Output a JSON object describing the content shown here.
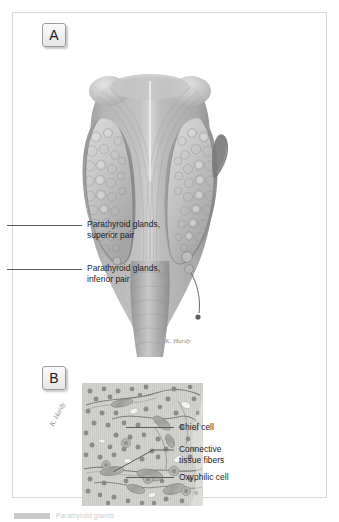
{
  "figure": {
    "panels": [
      {
        "id": "A",
        "letter": "A",
        "kind": "gross-anatomy-illustration",
        "subject": "Posterior view of the thyroid gland showing the parathyroid glands",
        "signature": "K. Hardy",
        "callouts": [
          {
            "id": "parathyroid-superior",
            "text": "Parathyroid glands,\nsuperior pair"
          },
          {
            "id": "parathyroid-inferior",
            "text": "Parathyroid glands,\ninferior pair"
          }
        ]
      },
      {
        "id": "B",
        "letter": "B",
        "kind": "histology-micrograph-illustration",
        "subject": "Parathyroid gland tissue, light micrograph drawing",
        "signature": "K. Hardy",
        "callouts": [
          {
            "id": "chief-cell",
            "text": "Chief cell"
          },
          {
            "id": "connective-tissue-fibers",
            "text": "Connective\ntissue fibers"
          },
          {
            "id": "oxyphilic-cell",
            "text": "Oxyphilic cell"
          }
        ]
      }
    ]
  },
  "caption": {
    "swatch_label": "",
    "text": "Parathyroid glands"
  },
  "palette": {
    "frame_border": "#d8d8d8",
    "page_background": "#ffffff",
    "leader_line": "#5a5a5a",
    "label_text": "#1c1c1c",
    "badge_border": "#9a9a9a",
    "tissue_background": "#cfcfcb",
    "chief_cell": "#8e8e92",
    "oxyphilic_cell": "#a9a9a2",
    "muscle_mid": "#a3a3a3",
    "gland_light": "#cdcdcd"
  }
}
